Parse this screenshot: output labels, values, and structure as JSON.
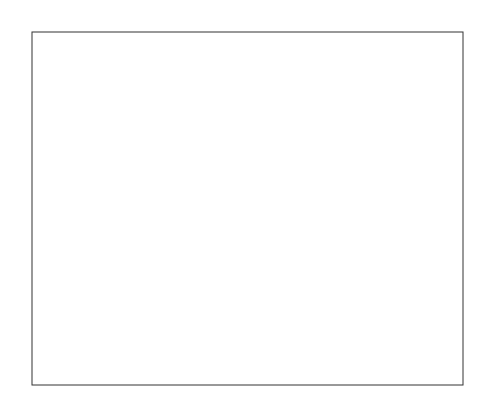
{
  "chart_data": {
    "type": "quiver",
    "xlabel": "",
    "ylabel": "",
    "xlim": [
      -3,
      3
    ],
    "ylim": [
      -3,
      3
    ],
    "xticks": [
      -3,
      -2,
      -1,
      0,
      1,
      2,
      3
    ],
    "yticks": [
      -3,
      -2,
      -1,
      0,
      1,
      2,
      3
    ],
    "xtick_labels": [
      "-3",
      "-2",
      "-1",
      "0",
      "1",
      "2",
      "3"
    ],
    "ytick_labels": [
      "-3",
      "-2",
      "-1",
      "0",
      "1",
      "2",
      "3"
    ],
    "grid": false,
    "function": "peaks: z = 3(1-x)^2 e^(-x^2-(y+1)^2) - 10(x/5 - x^3 - y^5) e^(-x^2-y^2) - 1/3 e^(-(x+1)^2-y^2)",
    "sample_grid": {
      "x_start": -3,
      "x_end": 3,
      "y_start": -3,
      "y_end": 3,
      "n": 20
    },
    "contour_levels": [
      -6,
      -4,
      -2,
      0,
      2,
      4,
      6
    ],
    "features": [
      {
        "label": "maximum",
        "x": 0.0,
        "y": 1.6
      },
      {
        "label": "minimum",
        "x": 0.2,
        "y": -1.6
      },
      {
        "label": "local maximum",
        "x": -1.3,
        "y": 0.0
      },
      {
        "label": "local minimum",
        "x": -0.5,
        "y": -0.6
      }
    ],
    "arrow_color": "#111111",
    "contour_color": "#777777"
  }
}
